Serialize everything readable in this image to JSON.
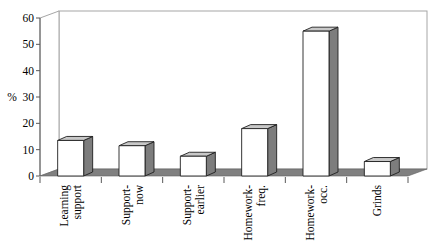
{
  "chart_data": {
    "type": "bar",
    "style": "3d-column",
    "title": "",
    "xlabel": "",
    "ylabel": "%",
    "categories": [
      "Learning support",
      "Support-now",
      "Support-earlier",
      "Homework-freq.",
      "Homework-occ.",
      "Grinds"
    ],
    "category_label_lines": [
      [
        "Learning",
        "support"
      ],
      [
        "Support-",
        "now"
      ],
      [
        "Support-",
        "earlier"
      ],
      [
        "Homework-",
        "freq."
      ],
      [
        "Homework-",
        "occ."
      ],
      [
        "Grinds"
      ]
    ],
    "values": [
      13.5,
      11.5,
      7.5,
      18,
      55,
      5.5
    ],
    "ylim": [
      0,
      60
    ],
    "yticks": [
      0,
      10,
      20,
      30,
      40,
      50,
      60
    ],
    "legend": "none",
    "grid": "off",
    "colors": {
      "background": "#ffffff",
      "bar_front": "#ffffff",
      "bar_side": "#7d7d7d",
      "bar_top": "#c8c8c8",
      "floor": "#808080",
      "floor_edge": "#5f5f5f",
      "wall_fill": "#ffffff",
      "wall_border": "#a6a6a6",
      "axis": "#595959",
      "bar_outline": "#1f1f1f",
      "text": "#000000"
    }
  }
}
